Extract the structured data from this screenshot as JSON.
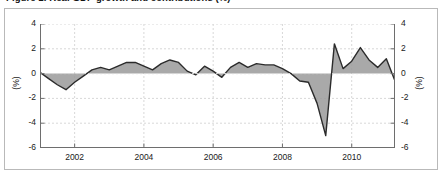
{
  "figure": {
    "title_clipped": "Figure 1. Real GDP growth and contributions (%)",
    "border_color": "#b9b9b9",
    "background": "#ffffff"
  },
  "axes": {
    "y_left_label": "(%)",
    "y_right_label": "(%)",
    "y_ticks": [
      4,
      2,
      0,
      -2,
      -4,
      -6
    ],
    "y_tick_labels": [
      "4",
      "2",
      "0",
      "-2",
      "-4",
      "-6"
    ],
    "x_ticks": [
      2002,
      2004,
      2006,
      2008,
      2010
    ],
    "x_tick_labels": [
      "2002",
      "2004",
      "2006",
      "2008",
      "2010"
    ],
    "grid": "dashed",
    "grid_color": "#d8d8d8",
    "axis_color": "#6e6e6e"
  },
  "chart_data": {
    "type": "area",
    "title": "Figure 1. Real GDP growth and contributions (%)",
    "xlabel": "",
    "ylabel": "(%)",
    "xlim": [
      2001.0,
      2011.25
    ],
    "ylim": [
      -6,
      4
    ],
    "ytick_interval": 2,
    "zero_line": 0,
    "series_name": "Quarterly growth rate",
    "fill_color": "#9a9a9a",
    "line_color": "#2b2b2b",
    "x": [
      2001.0,
      2001.25,
      2001.5,
      2001.75,
      2002.0,
      2002.25,
      2002.5,
      2002.75,
      2003.0,
      2003.25,
      2003.5,
      2003.75,
      2004.0,
      2004.25,
      2004.5,
      2004.75,
      2005.0,
      2005.25,
      2005.5,
      2005.75,
      2006.0,
      2006.25,
      2006.5,
      2006.75,
      2007.0,
      2007.25,
      2007.5,
      2007.75,
      2008.0,
      2008.25,
      2008.5,
      2008.75,
      2009.0,
      2009.25,
      2009.5,
      2009.75,
      2010.0,
      2010.25,
      2010.5,
      2010.75,
      2011.0,
      2011.25
    ],
    "values": [
      0.1,
      -0.4,
      -0.9,
      -1.3,
      -0.7,
      -0.2,
      0.3,
      0.5,
      0.3,
      0.6,
      0.9,
      0.9,
      0.6,
      0.3,
      0.8,
      1.1,
      0.9,
      0.2,
      -0.1,
      0.6,
      0.2,
      -0.3,
      0.5,
      0.9,
      0.5,
      0.8,
      0.7,
      0.7,
      0.4,
      0.0,
      -0.6,
      -0.7,
      -2.4,
      -5.0,
      2.4,
      0.4,
      1.0,
      2.1,
      1.1,
      0.5,
      1.2,
      -0.6
    ],
    "annotations": [
      {
        "label": "trough",
        "x": 2009.25,
        "y": -5.0
      },
      {
        "label": "rebound peak",
        "x": 2009.5,
        "y": 2.4
      },
      {
        "label": "recovery peak",
        "x": 2010.25,
        "y": 2.1
      }
    ]
  }
}
